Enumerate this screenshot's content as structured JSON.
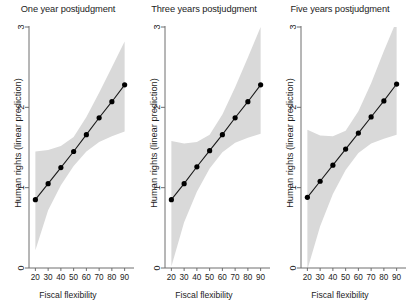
{
  "figure": {
    "background_color": "#ffffff",
    "band_color": "#d9d9d9",
    "line_color": "#1a1a1a",
    "marker_color": "#000000",
    "axis_color": "#6e6e6e"
  },
  "chart_data": [
    {
      "type": "line",
      "title": "One year postjudgment",
      "xlabel": "Fiscal flexibility",
      "ylabel": "Human rights (linear prediction)",
      "x": [
        20,
        30,
        40,
        50,
        60,
        70,
        80,
        90
      ],
      "values": [
        0.85,
        1.05,
        1.25,
        1.45,
        1.66,
        1.87,
        2.07,
        2.28
      ],
      "ci_lower": [
        0.22,
        0.72,
        1.03,
        1.27,
        1.45,
        1.57,
        1.64,
        1.7
      ],
      "ci_upper": [
        1.45,
        1.47,
        1.52,
        1.63,
        1.88,
        2.18,
        2.5,
        2.82
      ],
      "xticks": [
        20,
        30,
        40,
        50,
        60,
        70,
        80,
        90
      ],
      "yticks": [
        0,
        1,
        2,
        3
      ],
      "xlim": [
        15,
        95
      ],
      "ylim": [
        0,
        3
      ],
      "grid": false,
      "legend": "none",
      "series_name": "linear prediction",
      "band_name": "95% confidence interval"
    },
    {
      "type": "line",
      "title": "Three years postjudgment",
      "xlabel": "Fiscal flexibility",
      "ylabel": "Human rights (linear prediction)",
      "x": [
        20,
        30,
        40,
        50,
        60,
        70,
        80,
        90
      ],
      "values": [
        0.85,
        1.05,
        1.26,
        1.46,
        1.66,
        1.87,
        2.07,
        2.28
      ],
      "ci_lower": [
        0.02,
        0.57,
        0.95,
        1.24,
        1.44,
        1.56,
        1.62,
        1.67
      ],
      "ci_upper": [
        1.58,
        1.55,
        1.57,
        1.66,
        1.91,
        2.25,
        2.62,
        3.0
      ],
      "xticks": [
        20,
        30,
        40,
        50,
        60,
        70,
        80,
        90
      ],
      "yticks": [
        0,
        1,
        2,
        3
      ],
      "xlim": [
        15,
        95
      ],
      "ylim": [
        0,
        3
      ],
      "grid": false,
      "legend": "none",
      "series_name": "linear prediction",
      "band_name": "95% confidence interval"
    },
    {
      "type": "line",
      "title": "Five years postjudgment",
      "xlabel": "Fiscal flexibility",
      "ylabel": "Human rights (linear prediction)",
      "x": [
        20,
        30,
        40,
        50,
        60,
        70,
        80,
        90
      ],
      "values": [
        0.88,
        1.08,
        1.28,
        1.48,
        1.68,
        1.88,
        2.08,
        2.29
      ],
      "ci_lower": [
        -0.02,
        0.52,
        0.92,
        1.22,
        1.43,
        1.55,
        1.61,
        1.66
      ],
      "ci_upper": [
        1.72,
        1.65,
        1.64,
        1.71,
        1.95,
        2.3,
        2.7,
        3.08
      ],
      "xticks": [
        20,
        30,
        40,
        50,
        60,
        70,
        80,
        90
      ],
      "yticks": [
        0,
        1,
        2,
        3
      ],
      "xlim": [
        15,
        95
      ],
      "ylim": [
        0,
        3
      ],
      "grid": false,
      "legend": "none",
      "series_name": "linear prediction",
      "band_name": "95% confidence interval"
    }
  ],
  "panels": [
    {
      "title": "One year postjudgment",
      "xlabel": "Fiscal flexibility",
      "ylabel": "Human rights (linear prediction)"
    },
    {
      "title": "Three years postjudgment",
      "xlabel": "Fiscal flexibility",
      "ylabel": "Human rights (linear prediction)"
    },
    {
      "title": "Five years postjudgment",
      "xlabel": "Fiscal flexibility",
      "ylabel": "Human rights (linear prediction)"
    }
  ]
}
